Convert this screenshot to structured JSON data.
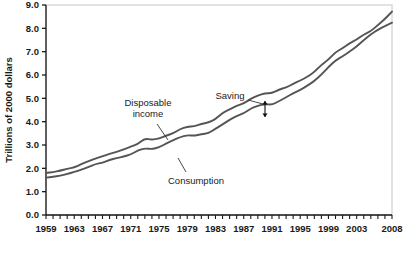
{
  "chart_data": {
    "type": "line",
    "title": "",
    "xlabel": "",
    "ylabel": "Trillions of 2000 dollars",
    "ylim": [
      0.0,
      9.0
    ],
    "xlim": [
      1959,
      2008
    ],
    "ytick_step": 1.0,
    "grid": false,
    "legend": "none",
    "yticks": [
      "0.0",
      "1.0",
      "2.0",
      "3.0",
      "4.0",
      "5.0",
      "6.0",
      "7.0",
      "8.0",
      "9.0"
    ],
    "ytick_values": [
      0.0,
      1.0,
      2.0,
      3.0,
      4.0,
      5.0,
      6.0,
      7.0,
      8.0,
      9.0
    ],
    "xticks": [
      "1959",
      "1963",
      "1967",
      "1971",
      "1975",
      "1979",
      "1983",
      "1987",
      "1991",
      "1995",
      "1999",
      "2003",
      "2008"
    ],
    "xtick_values": [
      1959,
      1963,
      1967,
      1971,
      1975,
      1979,
      1983,
      1987,
      1991,
      1995,
      1999,
      2003,
      2008
    ],
    "x": [
      1959,
      1960,
      1961,
      1962,
      1963,
      1964,
      1965,
      1966,
      1967,
      1968,
      1969,
      1970,
      1971,
      1972,
      1973,
      1974,
      1975,
      1976,
      1977,
      1978,
      1979,
      1980,
      1981,
      1982,
      1983,
      1984,
      1985,
      1986,
      1987,
      1988,
      1989,
      1990,
      1991,
      1992,
      1993,
      1994,
      1995,
      1996,
      1997,
      1998,
      1999,
      2000,
      2001,
      2002,
      2003,
      2004,
      2005,
      2006,
      2007,
      2008
    ],
    "series": [
      {
        "name": "Disposable income",
        "color": "#555555",
        "values": [
          1.8,
          1.84,
          1.9,
          1.98,
          2.04,
          2.18,
          2.3,
          2.42,
          2.52,
          2.62,
          2.7,
          2.82,
          2.92,
          3.04,
          3.28,
          3.22,
          3.28,
          3.4,
          3.5,
          3.68,
          3.78,
          3.8,
          3.9,
          3.96,
          4.1,
          4.38,
          4.52,
          4.68,
          4.78,
          4.98,
          5.12,
          5.22,
          5.22,
          5.38,
          5.46,
          5.62,
          5.76,
          5.92,
          6.12,
          6.44,
          6.66,
          6.98,
          7.14,
          7.36,
          7.52,
          7.74,
          7.88,
          8.14,
          8.4,
          8.72
        ],
        "endpoint_value": 8.72
      },
      {
        "name": "Consumption",
        "color": "#555555",
        "values": [
          1.6,
          1.64,
          1.68,
          1.76,
          1.84,
          1.94,
          2.06,
          2.18,
          2.24,
          2.36,
          2.44,
          2.5,
          2.6,
          2.76,
          2.86,
          2.82,
          2.9,
          3.06,
          3.2,
          3.34,
          3.42,
          3.4,
          3.46,
          3.5,
          3.7,
          3.88,
          4.08,
          4.24,
          4.36,
          4.56,
          4.68,
          4.76,
          4.72,
          4.88,
          5.04,
          5.22,
          5.36,
          5.54,
          5.74,
          6.02,
          6.34,
          6.62,
          6.8,
          7.0,
          7.22,
          7.5,
          7.74,
          7.94,
          8.1,
          8.24
        ],
        "endpoint_value": 8.24
      }
    ],
    "annotations": [
      {
        "id": "disposable-income",
        "text_line1": "Disposable",
        "text_line2": "income",
        "label_x": 148,
        "label_y": 106,
        "leader": {
          "x1": 157,
          "y1": 124,
          "x2": 168,
          "y2": 140
        }
      },
      {
        "id": "consumption",
        "text_line1": "Consumption",
        "text_line2": "",
        "label_x": 196,
        "label_y": 184,
        "leader": {
          "x1": 186,
          "y1": 172,
          "x2": 178,
          "y2": 158
        }
      },
      {
        "id": "saving",
        "text_line1": "Saving",
        "text_line2": "",
        "label_x": 230,
        "label_y": 99,
        "leader": {
          "x1": 248,
          "y1": 100,
          "x2": 263,
          "y2": 104
        }
      }
    ],
    "saving_marker": {
      "x": 265,
      "y_top": 101,
      "y_bottom": 117,
      "description": "double-headed vertical arrow measuring gap between curves"
    }
  },
  "figure": {
    "background_color": "#ffffff",
    "frame_color": "#cfcfcf",
    "axis_color": "#1a1a1a",
    "line_color": "#555555",
    "plot_left": 46,
    "plot_right": 392,
    "plot_top": 5,
    "plot_bottom": 215
  }
}
